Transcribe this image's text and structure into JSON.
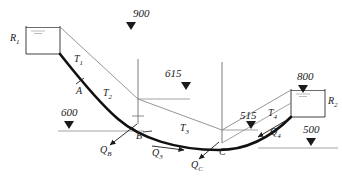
{
  "figure": {
    "type": "hydraulic-pipe-network-schematic",
    "reservoirs": [
      {
        "id": "R1",
        "label": "R",
        "sub": "1",
        "water_surface_elevation": "900",
        "side": "left"
      },
      {
        "id": "R2",
        "label": "R",
        "sub": "2",
        "water_surface_elevation": "800",
        "side": "right"
      }
    ],
    "elevation_markers": [
      {
        "value": "900",
        "x": 140,
        "y": 12,
        "marker_x": 131,
        "marker_y": 26
      },
      {
        "value": "615",
        "x": 163,
        "y": 72,
        "marker_x": 186,
        "marker_y": 86
      },
      {
        "value": "600",
        "x": 67,
        "y": 111,
        "marker_x": 69,
        "marker_y": 125
      },
      {
        "value": "800",
        "x": 309,
        "y": 75,
        "marker_x": 303,
        "marker_y": 89
      },
      {
        "value": "515",
        "x": 248,
        "y": 113,
        "marker_x": 251,
        "marker_y": 125
      },
      {
        "value": "500",
        "x": 312,
        "y": 134,
        "marker_x": 311,
        "marker_y": 147
      }
    ],
    "pipes": [
      {
        "label": "T",
        "sub": "1",
        "x": 76,
        "y": 60
      },
      {
        "label": "T",
        "sub": "2",
        "x": 105,
        "y": 94
      },
      {
        "label": "T",
        "sub": "3",
        "x": 183,
        "y": 128
      },
      {
        "label": "T",
        "sub": "4",
        "x": 271,
        "y": 112
      }
    ],
    "junctions": [
      {
        "label": "A",
        "x": 79,
        "y": 91
      },
      {
        "label": "B",
        "x": 137,
        "y": 135
      },
      {
        "label": "C",
        "x": 219,
        "y": 150
      }
    ],
    "discharges": [
      {
        "label": "Q",
        "sub": "B",
        "x": 107,
        "y": 148,
        "arrow_from": [
          131,
          127
        ],
        "arrow_to": [
          110,
          145
        ]
      },
      {
        "label": "Q",
        "sub": "3",
        "x": 155,
        "y": 148,
        "arrow_from": [
          152,
          144
        ],
        "arrow_to": [
          186,
          148
        ]
      },
      {
        "label": "Q",
        "sub": "C",
        "x": 196,
        "y": 163,
        "arrow_from": [
          216,
          143
        ],
        "arrow_to": [
          196,
          160
        ]
      },
      {
        "label": "Q",
        "sub": "4",
        "x": 274,
        "y": 130,
        "arrow_from": [
          283,
          122
        ],
        "arrow_to": [
          257,
          138
        ]
      }
    ]
  }
}
